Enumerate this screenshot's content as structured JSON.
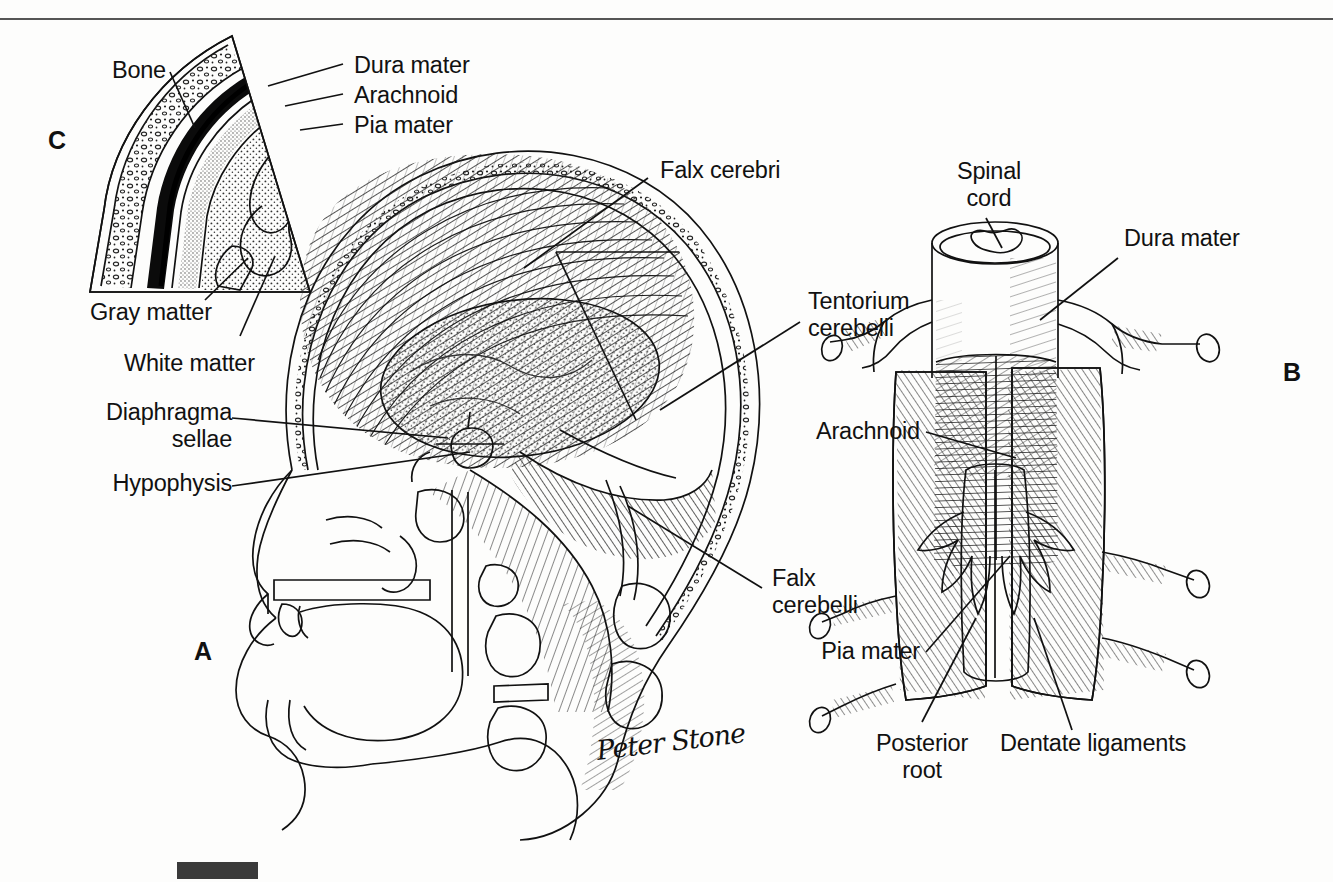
{
  "figure": {
    "background_color": "#fdfdfc",
    "ink_color": "#111111",
    "signature": "Peter Stone",
    "top_rule": true,
    "scale_bar": true
  },
  "panels": [
    {
      "id": "A",
      "letter": "A",
      "caption": "Midsagittal section of the head showing the cranial meninges, falx cerebri, tentorium cerebelli and falx cerebelli"
    },
    {
      "id": "B",
      "letter": "B",
      "caption": "Posterior view of the spinal cord with the dura mater opened to show arachnoid, pia mater and dentate ligaments"
    },
    {
      "id": "C",
      "letter": "C",
      "caption": "Magnified wedge of the cranial wall showing bone, dura mater, arachnoid, pia mater, gray matter and white matter"
    }
  ],
  "labels": {
    "bone": "Bone",
    "dura_mater_c": "Dura mater",
    "arachnoid_c": "Arachnoid",
    "pia_mater_c": "Pia mater",
    "gray_matter": "Gray matter",
    "white_matter": "White matter",
    "diaphragma_sellae": "Diaphragma\nsellae",
    "hypophysis": "Hypophysis",
    "falx_cerebri": "Falx cerebri",
    "tentorium_cerebelli": "Tentorium\ncerebelli",
    "falx_cerebelli": "Falx\ncerebelli",
    "spinal_cord": "Spinal\ncord",
    "dura_mater_b": "Dura mater",
    "arachnoid_b": "Arachnoid",
    "pia_mater_b": "Pia mater",
    "posterior_root": "Posterior\nroot",
    "dentate_ligaments": "Dentate ligaments"
  }
}
